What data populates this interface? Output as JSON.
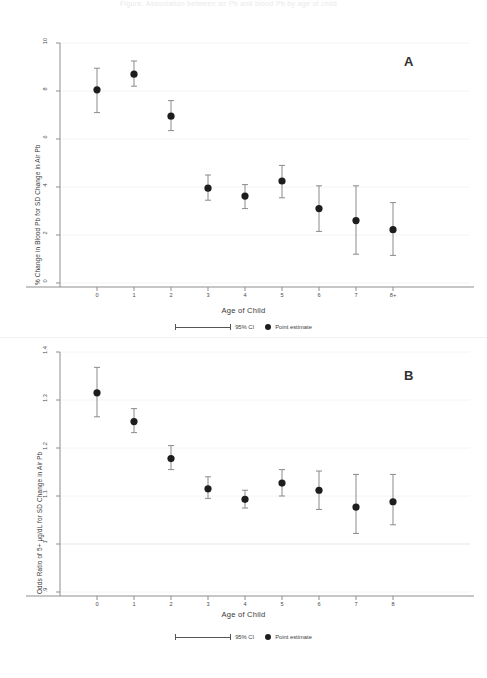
{
  "figure": {
    "title_faint": "Figure. Association between air Pb and blood Pb by age of child",
    "background": "#ffffff",
    "marker_color": "#1d1d1d",
    "whisker_color": "#8a8a8a",
    "axis_color": "#8e8e8e",
    "grid_color": "#f4f4f6"
  },
  "legend": {
    "ci_label": "95% CI",
    "point_label": "Point estimate",
    "ci_icon": "error-bar-icon",
    "point_icon": "filled-circle-icon"
  },
  "panel_a": {
    "letter": "A",
    "xlabel": "Age of Child",
    "ylabel": "% Change in Blood Pb for SD Change in Air Pb",
    "yticks": [
      "0",
      "2",
      "4",
      "6",
      "8",
      "10"
    ],
    "xticks": [
      "0",
      "1",
      "2",
      "3",
      "4",
      "5",
      "6",
      "7",
      "8+"
    ]
  },
  "panel_b": {
    "letter": "B",
    "xlabel": "Age of Child",
    "ylabel": "Odds Ratio of 5+ µg/dL for SD Change in Air Pb",
    "yticks": [
      ".9",
      "1",
      "1.1",
      "1.2",
      "1.3",
      "1.4"
    ],
    "xticks": [
      "0",
      "1",
      "2",
      "3",
      "4",
      "5",
      "6",
      "7",
      "8"
    ]
  },
  "chart_data": [
    {
      "type": "scatter",
      "panel": "A",
      "title": "",
      "xlabel": "Age of Child",
      "ylabel": "% Change in Blood Pb for SD Change in Air Pb",
      "categories": [
        "0",
        "1",
        "2",
        "3",
        "4",
        "5",
        "6",
        "7",
        "8+"
      ],
      "values": [
        8.05,
        8.7,
        6.95,
        3.95,
        3.62,
        4.25,
        3.1,
        2.6,
        2.22
      ],
      "ci_low": [
        7.1,
        8.2,
        6.35,
        3.45,
        3.1,
        3.55,
        2.15,
        1.2,
        1.15
      ],
      "ci_high": [
        8.95,
        9.25,
        7.6,
        4.5,
        4.1,
        4.9,
        4.05,
        4.05,
        3.35
      ],
      "ylim": [
        0,
        10
      ],
      "yticks": [
        0,
        2,
        4,
        6,
        8,
        10
      ],
      "grid": true,
      "legend": [
        "95% CI",
        "Point estimate"
      ],
      "legend_position": "bottom"
    },
    {
      "type": "scatter",
      "panel": "B",
      "title": "",
      "xlabel": "Age of Child",
      "ylabel": "Odds Ratio of 5+ µg/dL for SD Change in Air Pb",
      "categories": [
        "0",
        "1",
        "2",
        "3",
        "4",
        "5",
        "6",
        "7",
        "8"
      ],
      "values": [
        1.315,
        1.255,
        1.178,
        1.115,
        1.093,
        1.127,
        1.112,
        1.077,
        1.088
      ],
      "ci_low": [
        1.265,
        1.232,
        1.155,
        1.095,
        1.075,
        1.1,
        1.072,
        1.022,
        1.04
      ],
      "ci_high": [
        1.368,
        1.282,
        1.205,
        1.14,
        1.112,
        1.155,
        1.152,
        1.145,
        1.145
      ],
      "ylim": [
        0.9,
        1.4
      ],
      "yticks": [
        0.9,
        1.0,
        1.1,
        1.2,
        1.3,
        1.4
      ],
      "grid": true,
      "reference_line": 1.0,
      "legend": [
        "95% CI",
        "Point estimate"
      ],
      "legend_position": "bottom"
    }
  ]
}
